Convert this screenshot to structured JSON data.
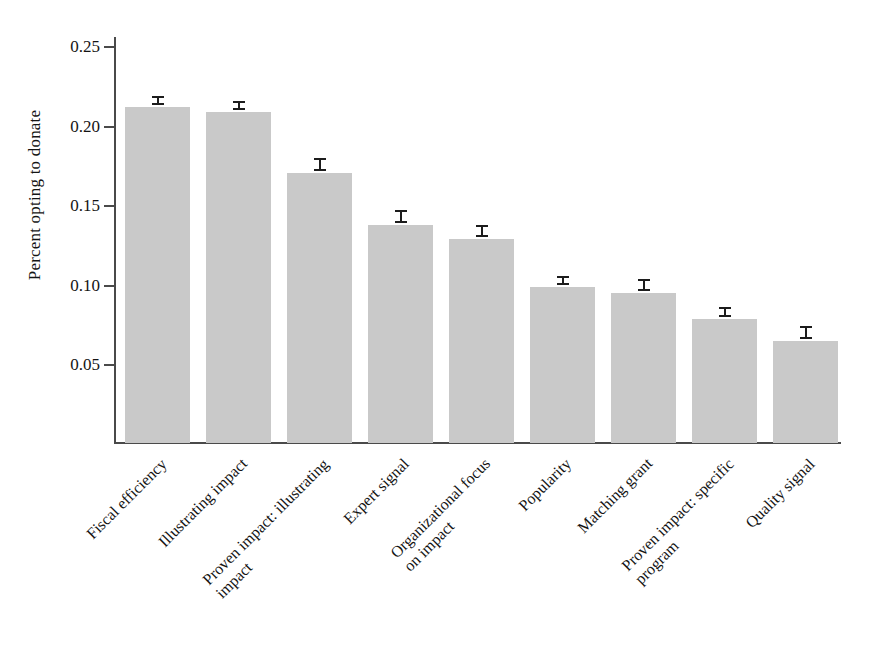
{
  "chart_data": {
    "type": "bar",
    "title": "",
    "subtitle": "",
    "xlabel": "",
    "ylabel": "Percent opting to donate",
    "ylim": [
      0.0,
      0.26
    ],
    "grid": false,
    "legend": null,
    "y_ticks": [
      "0.05",
      "0.10",
      "0.15",
      "0.20",
      "0.25"
    ],
    "y_tick_values": [
      0.05,
      0.1,
      0.15,
      0.2,
      0.25
    ],
    "bar_color": "#c9c9c9",
    "error_bar_color": "#1c1c1c",
    "axis_color": "#4a4a4a",
    "categories": [
      "Fiscal efficiency",
      "Illustrating impact",
      "Proven impact: illustrating\nimpact",
      "Expert signal",
      "Organizational focus\non impact",
      "Popularity",
      "Matching grant",
      "Proven impact: specific\nprogram",
      "Quality signal"
    ],
    "values": [
      0.212,
      0.209,
      0.171,
      0.138,
      0.129,
      0.099,
      0.095,
      0.079,
      0.065
    ],
    "errors": [
      0.003,
      0.003,
      0.004,
      0.004,
      0.004,
      0.003,
      0.004,
      0.003,
      0.004
    ]
  }
}
